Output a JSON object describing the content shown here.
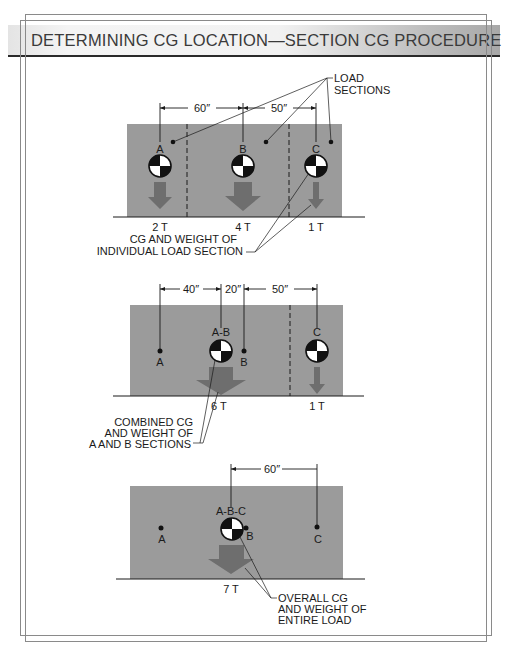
{
  "title": "DETERMINING CG LOCATION—SECTION CG PROCEDURE",
  "colors": {
    "load_fill": "#9b9b9b",
    "arrow_fill": "#6e6e6e",
    "line": "#1a1a1a",
    "frame": "#8a8a8a"
  },
  "panels": [
    {
      "id": "individual-sections",
      "dimensions": [
        {
          "label": "60″"
        },
        {
          "label": "50″"
        }
      ],
      "cg_labels": [
        "A",
        "B",
        "C"
      ],
      "weights": [
        "2 T",
        "4 T",
        "1 T"
      ],
      "callouts": {
        "load_sections": [
          "LOAD",
          "SECTIONS"
        ],
        "cg_and_weight": [
          "CG AND WEIGHT OF",
          "INDIVIDUAL LOAD SECTION"
        ]
      }
    },
    {
      "id": "combined-ab",
      "dimensions": [
        {
          "label": "40″"
        },
        {
          "label": "20″"
        },
        {
          "label": "50″"
        }
      ],
      "point_labels": [
        "A",
        "B"
      ],
      "cg_labels": [
        "A-B",
        "C"
      ],
      "weights": [
        "6 T",
        "1 T"
      ],
      "callouts": {
        "combined": [
          "COMBINED CG",
          "AND WEIGHT OF",
          "A AND B SECTIONS"
        ]
      }
    },
    {
      "id": "overall",
      "dimensions": [
        {
          "label": "60″"
        }
      ],
      "point_labels": [
        "A",
        "B",
        "C"
      ],
      "cg_labels": [
        "A-B-C"
      ],
      "weights": [
        "7 T"
      ],
      "callouts": {
        "overall": [
          "OVERALL CG",
          "AND WEIGHT OF",
          "ENTIRE LOAD"
        ]
      }
    }
  ]
}
